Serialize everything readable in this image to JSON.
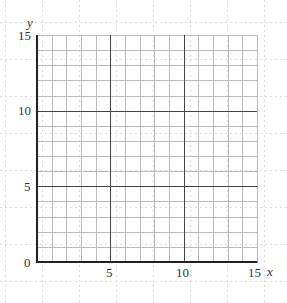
{
  "diagram": {
    "type": "coordinate-grid",
    "x_axis": {
      "label": "x",
      "min": 0,
      "max": 15,
      "ticks": [
        {
          "value": 5,
          "label": "5"
        },
        {
          "value": 10,
          "label": "10"
        },
        {
          "value": 15,
          "label": "15"
        }
      ]
    },
    "y_axis": {
      "label": "y",
      "min": 0,
      "max": 15,
      "ticks": [
        {
          "value": 5,
          "label": "5"
        },
        {
          "value": 10,
          "label": "10"
        },
        {
          "value": 15,
          "label": "15"
        }
      ]
    },
    "origin_label": "0",
    "minor_step": 1,
    "major_step": 5,
    "colors": {
      "axis": "#222222",
      "major": "#444444",
      "minor": "#bbbbbb",
      "background_dots": "#dddddd"
    }
  }
}
